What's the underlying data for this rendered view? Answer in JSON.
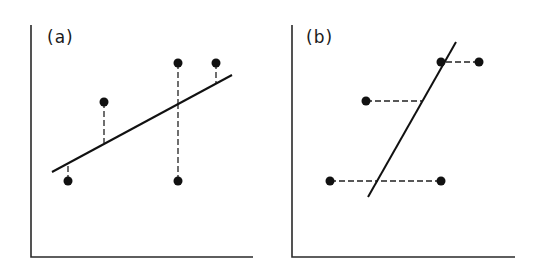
{
  "panels": [
    {
      "label": "(a)",
      "description": "Least squares regression of y on x: vertical residuals",
      "axes": {
        "origin": [
          31,
          257
        ],
        "y_top": 25,
        "x_right": 253
      },
      "fit_line": {
        "x1": 52,
        "y1": 172,
        "x2": 232,
        "y2": 75
      },
      "residual_direction": "vertical",
      "points": [
        {
          "x": 68,
          "y": 181,
          "foot_x": 68,
          "foot_y": 163
        },
        {
          "x": 104,
          "y": 102,
          "foot_x": 104,
          "foot_y": 143
        },
        {
          "x": 178,
          "y": 63,
          "foot_x": 178,
          "foot_y": 103
        },
        {
          "x": 178,
          "y": 181,
          "foot_x": 178,
          "foot_y": 103
        },
        {
          "x": 216,
          "y": 63,
          "foot_x": 216,
          "foot_y": 83
        }
      ]
    },
    {
      "label": "(b)",
      "description": "Least squares regression of x on y: horizontal residuals",
      "axes": {
        "origin": [
          292,
          257
        ],
        "y_top": 25,
        "x_right": 515
      },
      "fit_line": {
        "x1": 368,
        "y1": 197,
        "x2": 456,
        "y2": 42
      },
      "residual_direction": "horizontal",
      "points": [
        {
          "x": 330,
          "y": 181,
          "foot_x": 377,
          "foot_y": 181
        },
        {
          "x": 441,
          "y": 181,
          "foot_x": 377,
          "foot_y": 181
        },
        {
          "x": 366,
          "y": 101,
          "foot_x": 422,
          "foot_y": 101
        },
        {
          "x": 441,
          "y": 62,
          "foot_x": 444,
          "foot_y": 62
        },
        {
          "x": 479,
          "y": 62,
          "foot_x": 444,
          "foot_y": 62
        }
      ]
    }
  ],
  "colors": {
    "ink": "#111111",
    "background": "#ffffff"
  }
}
